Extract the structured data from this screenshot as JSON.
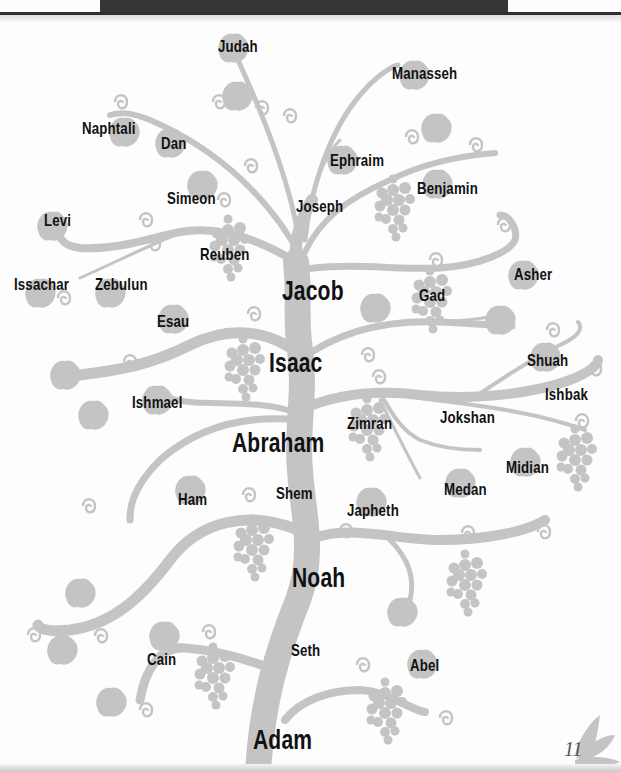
{
  "page": {
    "page_number": "11",
    "colors": {
      "tree": "#c4c4c4",
      "banner": "#353535",
      "text": "#111111"
    }
  },
  "tree": {
    "main_line": [
      "Adam",
      "Seth",
      "Noah",
      "Shem",
      "Abraham",
      "Isaac",
      "Jacob"
    ],
    "names": {
      "judah": "Judah",
      "manasseh": "Manasseh",
      "naphtali": "Naphtali",
      "dan": "Dan",
      "ephraim": "Ephraim",
      "simeon": "Simeon",
      "benjamin": "Benjamin",
      "joseph": "Joseph",
      "levi": "Levi",
      "reuben": "Reuben",
      "issachar": "Issachar",
      "zebulun": "Zebulun",
      "jacob": "Jacob",
      "gad": "Gad",
      "asher": "Asher",
      "esau": "Esau",
      "isaac": "Isaac",
      "shuah": "Shuah",
      "ishbak": "Ishbak",
      "ishmael": "Ishmael",
      "zimran": "Zimran",
      "jokshan": "Jokshan",
      "abraham": "Abraham",
      "midian": "Midian",
      "medan": "Medan",
      "ham": "Ham",
      "shem": "Shem",
      "japheth": "Japheth",
      "noah": "Noah",
      "cain": "Cain",
      "seth": "Seth",
      "abel": "Abel",
      "adam": "Adam"
    }
  }
}
